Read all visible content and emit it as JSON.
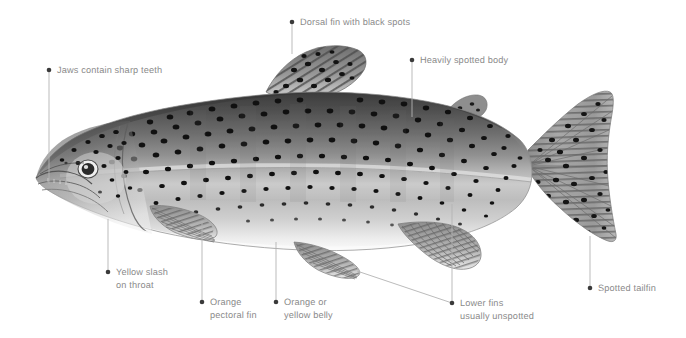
{
  "diagram": {
    "background_color": "#ffffff",
    "label_color": "#8a8a8a",
    "leader_color": "#b3b3b3",
    "dot_color": "#3a3a3a"
  },
  "callouts": [
    {
      "id": "jaws",
      "name": "callout-jaws-contain-sharp-teeth",
      "line1": "Jaws contain sharp teeth",
      "line2": "",
      "dot": {
        "x": 49,
        "y": 70
      },
      "text": {
        "x": 57,
        "y": 64
      },
      "leader": [
        {
          "x": 49,
          "y": 70
        },
        {
          "x": 49,
          "y": 184
        }
      ]
    },
    {
      "id": "dorsal-fin",
      "name": "callout-dorsal-fin-with-black-spots",
      "line1": "Dorsal fin with black spots",
      "line2": "",
      "dot": {
        "x": 292,
        "y": 22
      },
      "text": {
        "x": 300,
        "y": 16
      },
      "leader": [
        {
          "x": 292,
          "y": 22
        },
        {
          "x": 292,
          "y": 54
        }
      ]
    },
    {
      "id": "spotted-body",
      "name": "callout-heavily-spotted-body",
      "line1": "Heavily spotted body",
      "line2": "",
      "dot": {
        "x": 412,
        "y": 60
      },
      "text": {
        "x": 420,
        "y": 54
      },
      "leader": [
        {
          "x": 412,
          "y": 60
        },
        {
          "x": 412,
          "y": 117
        }
      ]
    },
    {
      "id": "yellow-slash",
      "name": "callout-yellow-slash-on-throat",
      "line1": "Yellow slash",
      "line2": "on throat",
      "dot": {
        "x": 108,
        "y": 272
      },
      "text": {
        "x": 116,
        "y": 266
      },
      "leader": [
        {
          "x": 108,
          "y": 272
        },
        {
          "x": 108,
          "y": 219
        }
      ]
    },
    {
      "id": "pectoral-fin",
      "name": "callout-orange-pectoral-fin",
      "line1": "Orange",
      "line2": "pectoral fin",
      "dot": {
        "x": 202,
        "y": 302
      },
      "text": {
        "x": 210,
        "y": 296
      },
      "leader": [
        {
          "x": 202,
          "y": 302
        },
        {
          "x": 202,
          "y": 221
        }
      ]
    },
    {
      "id": "belly",
      "name": "callout-orange-or-yellow-belly",
      "line1": "Orange or",
      "line2": "yellow belly",
      "dot": {
        "x": 276,
        "y": 302
      },
      "text": {
        "x": 284,
        "y": 296
      },
      "leader": [
        {
          "x": 276,
          "y": 302
        },
        {
          "x": 276,
          "y": 242
        }
      ]
    },
    {
      "id": "lower-fins",
      "name": "callout-lower-fins-usually-unspotted",
      "line1": "Lower fins",
      "line2": "usually unspotted",
      "dot": {
        "x": 452,
        "y": 303
      },
      "text": {
        "x": 460,
        "y": 297
      },
      "leader": [
        {
          "x": 452,
          "y": 303
        },
        {
          "x": 452,
          "y": 204
        }
      ],
      "leader2": [
        {
          "x": 452,
          "y": 303
        },
        {
          "x": 357,
          "y": 271
        }
      ]
    },
    {
      "id": "tailfin",
      "name": "callout-spotted-tailfin",
      "line1": "Spotted tailfin",
      "line2": "",
      "dot": {
        "x": 590,
        "y": 288
      },
      "text": {
        "x": 598,
        "y": 282
      },
      "leader": [
        {
          "x": 590,
          "y": 288
        },
        {
          "x": 590,
          "y": 236
        }
      ]
    }
  ],
  "fish": {
    "name": "rainbow-trout-illustration",
    "orientation": "facing-left",
    "parts": [
      {
        "name": "body",
        "label": "Heavily spotted body"
      },
      {
        "name": "head",
        "label": "Head with jaws and teeth"
      },
      {
        "name": "eye",
        "label": "Eye"
      },
      {
        "name": "dorsal-fin",
        "label": "Dorsal fin with black spots"
      },
      {
        "name": "adipose-fin",
        "label": "Adipose fin"
      },
      {
        "name": "pectoral-fin",
        "label": "Orange pectoral fin"
      },
      {
        "name": "pelvic-fin",
        "label": "Pelvic fin"
      },
      {
        "name": "anal-fin",
        "label": "Anal fin"
      },
      {
        "name": "caudal-fin",
        "label": "Spotted tailfin"
      },
      {
        "name": "lateral-line",
        "label": "Lateral line"
      },
      {
        "name": "belly",
        "label": "Orange or yellow belly"
      }
    ]
  }
}
